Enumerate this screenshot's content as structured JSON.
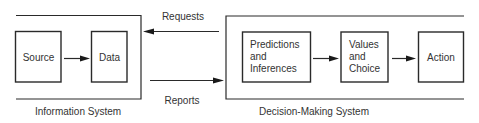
{
  "diagram": {
    "information_system": {
      "label": "Information System",
      "nodes": [
        {
          "id": "source",
          "label": "Source"
        },
        {
          "id": "data",
          "label": "Data"
        }
      ]
    },
    "decision_system": {
      "label": "Decision-Making System",
      "nodes": [
        {
          "id": "predictions",
          "lines": [
            "Predictions",
            "and",
            "Inferences"
          ]
        },
        {
          "id": "values",
          "lines": [
            "Values",
            "and",
            "Choice"
          ]
        },
        {
          "id": "action",
          "label": "Action"
        }
      ]
    },
    "flows": {
      "requests": "Requests",
      "reports": "Reports"
    },
    "edges": [
      {
        "from": "source",
        "to": "data"
      },
      {
        "from": "predictions",
        "to": "values"
      },
      {
        "from": "values",
        "to": "action"
      },
      {
        "from": "decision_system",
        "to": "information_system",
        "label": "Requests"
      },
      {
        "from": "information_system",
        "to": "decision_system",
        "label": "Reports"
      }
    ]
  }
}
